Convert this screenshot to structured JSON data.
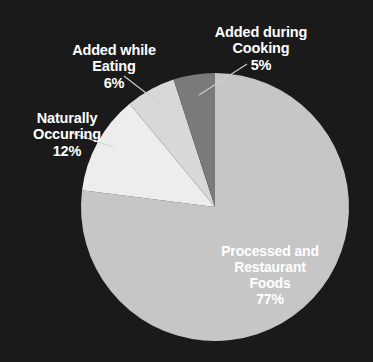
{
  "background_color": "#1a1a1a",
  "chart_data": {
    "type": "pie",
    "title": "",
    "subtitle": "",
    "xlabel": "",
    "ylabel": "",
    "legend_position": "none",
    "grid": false,
    "units": "percent",
    "total": 100,
    "start_angle_deg": 0,
    "direction": "clockwise",
    "categories": [
      "Processed and Restaurant Foods",
      "Naturally Occurring",
      "Added while Eating",
      "Added during Cooking"
    ],
    "values": [
      77,
      12,
      6,
      5
    ],
    "colors": [
      "#c6c6c6",
      "#ededed",
      "#d8d8d8",
      "#7a7a7a"
    ],
    "slices": [
      {
        "label": "Processed and Restaurant Foods",
        "label_lines": "Processed and\nRestaurant\nFoods",
        "percent_text": "77%",
        "value": 77,
        "color": "#c6c6c6",
        "label_placement": "inside"
      },
      {
        "label": "Naturally Occurring",
        "label_lines": "Naturally\nOccurring",
        "percent_text": "12%",
        "value": 12,
        "color": "#ededed",
        "label_placement": "outside-left"
      },
      {
        "label": "Added while Eating",
        "label_lines": "Added while\nEating",
        "percent_text": "6%",
        "value": 6,
        "color": "#d8d8d8",
        "label_placement": "outside-top-left"
      },
      {
        "label": "Added during Cooking",
        "label_lines": "Added during\nCooking",
        "percent_text": "5%",
        "value": 5,
        "color": "#7a7a7a",
        "label_placement": "outside-top-right"
      }
    ]
  },
  "geometry": {
    "center_x": 215,
    "center_y": 207,
    "radius": 134
  },
  "leader_lines": {
    "cooking_color": "#cfcfcf",
    "eating_color": "#cfcfcf",
    "natural_color": "#cfcfcf"
  }
}
